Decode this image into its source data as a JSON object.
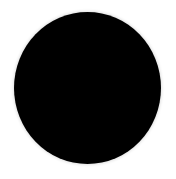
{
  "image": {
    "background_color": "#ffffff",
    "shape": {
      "type": "ellipse",
      "fill_color": "#000000"
    }
  }
}
